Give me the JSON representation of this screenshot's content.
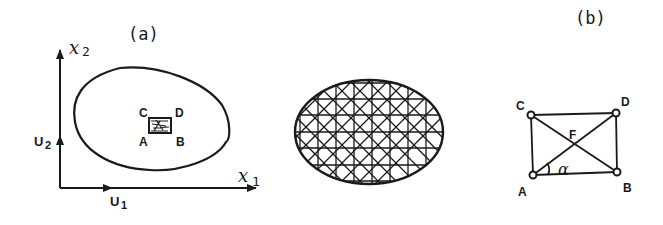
{
  "panel_a": {
    "title": "(a)",
    "axis_x_label": "x",
    "axis_x_sub": "1",
    "axis_y_label": "x",
    "axis_y_sub": "2",
    "unit_x_label": "U",
    "unit_x_sub": "1",
    "unit_y_label": "U",
    "unit_y_sub": "2",
    "corner_labels": {
      "a": "A",
      "b": "B",
      "c": "C",
      "d": "D"
    }
  },
  "panel_mesh": {
    "description": "Ellipse domain discretized with rectangular grid and diagonal triangulation"
  },
  "panel_b": {
    "title": "(b)",
    "corner_labels": {
      "a": "A",
      "b": "B",
      "c": "C",
      "d": "D"
    },
    "center_label": "F",
    "angle_label": "α"
  },
  "colors": {
    "ink": "#1a1a1a",
    "background": "#ffffff"
  }
}
